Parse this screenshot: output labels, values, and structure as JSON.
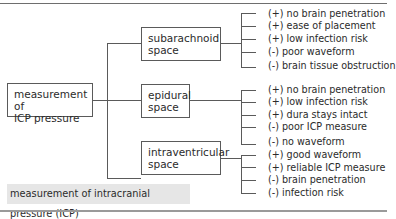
{
  "diagram": {
    "root": {
      "label_line1": "measurement of",
      "label_line2": "ICP pressure"
    },
    "branches": [
      {
        "label_line1": "subarachnoid",
        "label_line2": "space",
        "items": [
          "(+) no brain penetration",
          "(+) ease of placement",
          "(+) low infection risk",
          "(-) poor waveform",
          "(-) brain tissue obstruction"
        ]
      },
      {
        "label_line1": "epidural",
        "label_line2": "space",
        "items": [
          "(+) no brain penetration",
          "(+) low infection risk",
          "(+) dura stays intact",
          "(-) poor ICP measure",
          "(-) no waveform"
        ]
      },
      {
        "label_line1": "intraventricular",
        "label_line2": "space",
        "items": [
          "(+)  good waveform",
          "(+) reliable ICP measure",
          "(-) brain penetration",
          "(-) infection risk"
        ]
      }
    ],
    "caption": "measurement of intracranial pressure (ICP)"
  }
}
